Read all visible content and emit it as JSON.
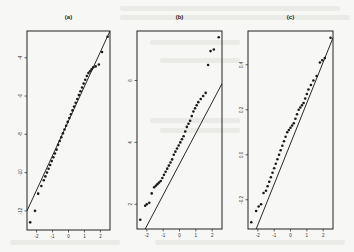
{
  "figure": {
    "panels": [
      {
        "id": "a",
        "label": "(a)"
      },
      {
        "id": "b",
        "label": "(b)"
      },
      {
        "id": "c",
        "label": "(c)"
      }
    ]
  },
  "chart_data": [
    {
      "type": "scatter",
      "title": "(a)",
      "subtype": "normal Q-Q plot with reference line",
      "xlabel": "",
      "ylabel": "",
      "xlim": [
        -2.6,
        2.6
      ],
      "ylim": [
        -13,
        -2.6
      ],
      "xticks": [
        -2,
        -1,
        0,
        1,
        2
      ],
      "yticks": [
        -12,
        -10,
        -8,
        -6,
        -4
      ],
      "ytick_labels_shown": [
        "-12",
        "-10",
        "-8",
        "-6",
        "-4"
      ],
      "grid": false,
      "reference_line": {
        "x": [
          -2.6,
          2.6
        ],
        "y": [
          -12.0,
          -2.6
        ]
      },
      "points": {
        "x": [
          -2.4,
          -2.1,
          -1.9,
          -1.7,
          -1.55,
          -1.45,
          -1.35,
          -1.25,
          -1.15,
          -1.05,
          -0.95,
          -0.85,
          -0.75,
          -0.65,
          -0.55,
          -0.45,
          -0.35,
          -0.25,
          -0.15,
          -0.05,
          0.05,
          0.15,
          0.25,
          0.35,
          0.45,
          0.55,
          0.65,
          0.75,
          0.85,
          0.95,
          1.05,
          1.15,
          1.25,
          1.35,
          1.45,
          1.55,
          1.7,
          1.9,
          2.1,
          2.45
        ],
        "y": [
          -12.6,
          -12.0,
          -11.1,
          -10.7,
          -10.4,
          -10.2,
          -10.0,
          -9.8,
          -9.6,
          -9.4,
          -9.2,
          -9.0,
          -8.8,
          -8.55,
          -8.35,
          -8.15,
          -7.95,
          -7.75,
          -7.55,
          -7.35,
          -7.15,
          -6.95,
          -6.75,
          -6.55,
          -6.35,
          -6.15,
          -5.95,
          -5.75,
          -5.55,
          -5.35,
          -5.15,
          -4.95,
          -4.8,
          -4.7,
          -4.6,
          -4.5,
          -4.45,
          -4.35,
          -3.7,
          -2.9
        ]
      }
    },
    {
      "type": "scatter",
      "title": "(b)",
      "subtype": "normal Q-Q plot with reference line",
      "xlabel": "",
      "ylabel": "",
      "xlim": [
        -2.6,
        2.6
      ],
      "ylim": [
        1.2,
        7.6
      ],
      "xticks": [
        -2,
        -1,
        0,
        1,
        2
      ],
      "yticks": [
        2,
        4,
        6
      ],
      "ytick_labels_shown": [
        "2",
        "4",
        "6"
      ],
      "grid": false,
      "reference_line": {
        "x": [
          -2.1,
          2.6
        ],
        "y": [
          1.2,
          5.9
        ]
      },
      "points": {
        "x": [
          -2.4,
          -2.1,
          -2.0,
          -1.85,
          -1.7,
          -1.55,
          -1.45,
          -1.35,
          -1.25,
          -1.15,
          -1.05,
          -0.95,
          -0.85,
          -0.75,
          -0.65,
          -0.55,
          -0.45,
          -0.35,
          -0.25,
          -0.15,
          -0.05,
          0.05,
          0.15,
          0.25,
          0.35,
          0.45,
          0.55,
          0.65,
          0.75,
          0.85,
          0.95,
          1.05,
          1.15,
          1.3,
          1.45,
          1.6,
          1.75,
          1.9,
          2.1,
          2.4
        ],
        "y": [
          1.5,
          1.95,
          2.0,
          2.05,
          2.35,
          2.55,
          2.6,
          2.65,
          2.7,
          2.75,
          2.85,
          2.95,
          3.05,
          3.15,
          3.25,
          3.35,
          3.45,
          3.6,
          3.7,
          3.8,
          3.9,
          4.0,
          4.1,
          4.2,
          4.35,
          4.5,
          4.6,
          4.7,
          4.85,
          5.0,
          5.1,
          5.2,
          5.3,
          5.4,
          5.5,
          5.6,
          6.5,
          6.95,
          7.0,
          7.4
        ]
      }
    },
    {
      "type": "scatter",
      "title": "(c)",
      "subtype": "normal Q-Q plot with reference line",
      "xlabel": "",
      "ylabel": "",
      "xlim": [
        -2.6,
        2.6
      ],
      "ylim": [
        -0.33,
        0.55
      ],
      "xticks": [
        -2,
        -1,
        0,
        1,
        2
      ],
      "yticks": [
        -0.2,
        0.0,
        0.2,
        0.4
      ],
      "ytick_labels_shown": [
        "-0.2",
        "0.0",
        "0.2",
        "0.4"
      ],
      "grid": false,
      "reference_line": {
        "x": [
          -2.1,
          2.6
        ],
        "y": [
          -0.33,
          0.52
        ]
      },
      "points": {
        "x": [
          -2.4,
          -2.1,
          -1.95,
          -1.8,
          -1.65,
          -1.5,
          -1.4,
          -1.3,
          -1.2,
          -1.1,
          -1.0,
          -0.9,
          -0.8,
          -0.7,
          -0.6,
          -0.5,
          -0.4,
          -0.3,
          -0.2,
          -0.1,
          0.0,
          0.1,
          0.2,
          0.3,
          0.4,
          0.5,
          0.6,
          0.7,
          0.8,
          0.9,
          1.0,
          1.1,
          1.25,
          1.4,
          1.6,
          1.8,
          1.95,
          2.1,
          2.45
        ],
        "y": [
          -0.3,
          -0.25,
          -0.23,
          -0.22,
          -0.17,
          -0.16,
          -0.14,
          -0.12,
          -0.1,
          -0.08,
          -0.06,
          -0.04,
          -0.02,
          0.0,
          0.02,
          0.04,
          0.06,
          0.08,
          0.1,
          0.11,
          0.12,
          0.13,
          0.14,
          0.16,
          0.18,
          0.2,
          0.21,
          0.22,
          0.23,
          0.25,
          0.27,
          0.29,
          0.31,
          0.33,
          0.35,
          0.41,
          0.42,
          0.43,
          0.52
        ]
      }
    }
  ]
}
